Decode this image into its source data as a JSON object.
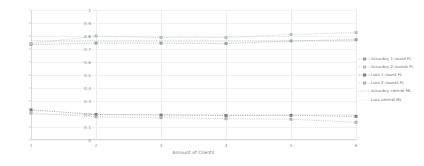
{
  "chart_data": {
    "type": "line",
    "title": "",
    "xlabel": "Amount of Clients",
    "ylabel": "",
    "x": [
      1,
      2,
      3,
      4,
      5,
      6
    ],
    "xtick_labels": [
      "1",
      "2",
      "3",
      "4",
      "5",
      "6"
    ],
    "ytick_labels": [
      "0",
      "0.1",
      "0.2",
      "0.3",
      "0.4",
      "0.5",
      "0.6",
      "0.7",
      "0.8",
      "0.9",
      "1"
    ],
    "ytick_values": [
      0,
      0.1,
      0.2,
      0.3,
      0.4,
      0.5,
      0.6,
      0.7,
      0.8,
      0.9,
      1
    ],
    "xlim": [
      1,
      6
    ],
    "ylim": [
      0,
      1
    ],
    "grid": true,
    "legend_position": "right",
    "series": [
      {
        "name": "Accuracy 1 round FL",
        "values": [
          0.735,
          0.745,
          0.745,
          0.742,
          0.762,
          0.772
        ],
        "color": "#9aa0a6",
        "style": "dashed",
        "marker": "square"
      },
      {
        "name": "Accuracy 2 rounds FL",
        "values": [
          0.742,
          0.8,
          0.788,
          0.788,
          0.812,
          0.826
        ],
        "color": "#b8bdc1",
        "style": "dashed",
        "marker": "square"
      },
      {
        "name": "Loss 1 round FL",
        "values": [
          0.232,
          0.196,
          0.192,
          0.188,
          0.19,
          0.182
        ],
        "color": "#7c8084",
        "style": "dashed",
        "marker": "square"
      },
      {
        "name": "Loss 2 rounds FL",
        "values": [
          0.208,
          0.178,
          0.172,
          0.164,
          0.16,
          0.136
        ],
        "color": "#b0b4b8",
        "style": "dashed",
        "marker": "square"
      },
      {
        "name": "Accuracy central ML",
        "values": [
          0.762,
          0.762,
          0.762,
          0.762,
          0.762,
          0.762
        ],
        "color": "#9aa0a6",
        "style": "dotted",
        "marker": "none"
      },
      {
        "name": "Loss central ML",
        "values": [
          0.762,
          0.762,
          0.762,
          0.762,
          0.762,
          0.762
        ],
        "color": "#d4d7d9",
        "style": "dotted",
        "marker": "none"
      }
    ]
  },
  "legend": {
    "items": [
      {
        "label": "Accuracy 1 round FL"
      },
      {
        "label": "Accuracy 2 rounds FL"
      },
      {
        "label": "Loss 1 round FL"
      },
      {
        "label": "Loss 2 rounds FL"
      },
      {
        "label": "Accuracy central ML"
      },
      {
        "label": "Loss central ML"
      }
    ]
  }
}
